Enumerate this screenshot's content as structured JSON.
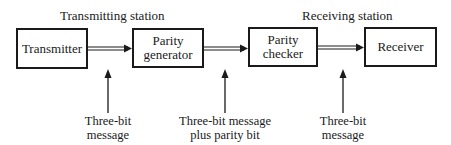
{
  "diagram": {
    "title_left": "Transmitting station",
    "title_right": "Receiving station",
    "blocks": [
      {
        "id": "transmitter",
        "label": "Transmitter"
      },
      {
        "id": "parity-generator",
        "label_line1": "Parity",
        "label_line2": "generator"
      },
      {
        "id": "parity-checker",
        "label_line1": "Parity",
        "label_line2": "checker"
      },
      {
        "id": "receiver",
        "label": "Receiver"
      }
    ],
    "signals": [
      {
        "label_line1": "Three-bit",
        "label_line2": "message"
      },
      {
        "label_line1": "Three-bit message",
        "label_line2": "plus parity bit"
      },
      {
        "label_line1": "Three-bit",
        "label_line2": "message"
      }
    ],
    "flow": [
      "Transmitter",
      "Parity generator",
      "Parity checker",
      "Receiver"
    ],
    "colors": {
      "ink": "#1a1a1a",
      "background": "#ffffff"
    }
  }
}
